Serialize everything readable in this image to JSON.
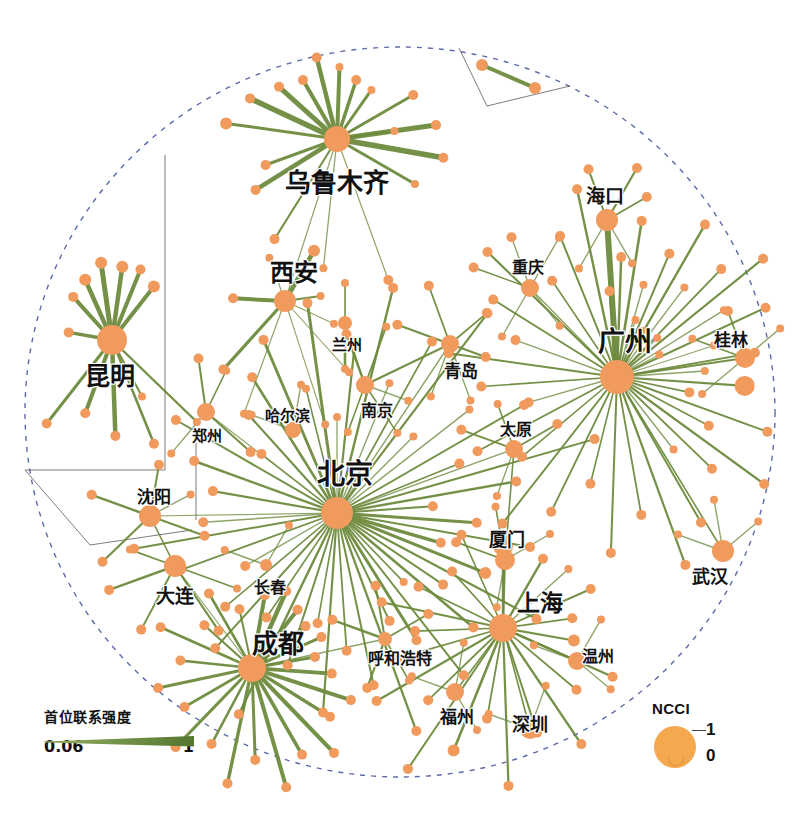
{
  "figure": {
    "title": "",
    "background": "#ffffff",
    "node_color": "#F09A5E",
    "edge_color": "#6E8B3D",
    "boundary_style": "dashed-circle",
    "boundary_color": "#5B6BA8"
  },
  "legend_strength": {
    "title": "首位联系强度",
    "min_label": "0.06",
    "max_label": "1",
    "bar_color": "#6E8B3D"
  },
  "legend_ncci": {
    "title": "NCCI",
    "max_label": "1",
    "min_label": "0",
    "circle_color": "#F5A94E"
  },
  "chart_data": {
    "type": "network",
    "node_size_metric": "NCCI",
    "node_size_range": [
      0,
      1
    ],
    "edge_weight_metric": "首位联系强度",
    "edge_weight_range": [
      0.06,
      1
    ],
    "labeled_nodes": [
      {
        "name": "乌鲁木齐",
        "x": 337,
        "y": 139,
        "r": 13,
        "label_x": 337,
        "label_y": 180,
        "font": 26
      },
      {
        "name": "西安",
        "x": 285,
        "y": 301,
        "r": 11,
        "label_x": 294,
        "label_y": 270,
        "font": 24
      },
      {
        "name": "昆明",
        "x": 112,
        "y": 340,
        "r": 15,
        "label_x": 110,
        "label_y": 374,
        "font": 25
      },
      {
        "name": "兰州",
        "x": 345,
        "y": 323,
        "r": 7,
        "label_x": 347,
        "label_y": 343,
        "font": 15
      },
      {
        "name": "青岛",
        "x": 450,
        "y": 344,
        "r": 9,
        "label_x": 461,
        "label_y": 369,
        "font": 17
      },
      {
        "name": "南京",
        "x": 365,
        "y": 385,
        "r": 9,
        "label_x": 377,
        "label_y": 409,
        "font": 16
      },
      {
        "name": "哈尔滨",
        "x": 293,
        "y": 430,
        "r": 8,
        "label_x": 287,
        "label_y": 414,
        "font": 15
      },
      {
        "name": "郑州",
        "x": 206,
        "y": 412,
        "r": 9,
        "label_x": 207,
        "label_y": 434,
        "font": 15
      },
      {
        "name": "北京",
        "x": 337,
        "y": 513,
        "r": 16,
        "label_x": 345,
        "label_y": 472,
        "font": 28
      },
      {
        "name": "沈阳",
        "x": 150,
        "y": 516,
        "r": 11,
        "label_x": 154,
        "label_y": 495,
        "font": 17
      },
      {
        "name": "大连",
        "x": 175,
        "y": 566,
        "r": 11,
        "label_x": 175,
        "label_y": 594,
        "font": 19
      },
      {
        "name": "长春",
        "x": 266,
        "y": 565,
        "r": 6,
        "label_x": 270,
        "label_y": 586,
        "font": 16
      },
      {
        "name": "成都",
        "x": 252,
        "y": 668,
        "r": 14,
        "label_x": 278,
        "label_y": 641,
        "font": 26
      },
      {
        "name": "呼和浩特",
        "x": 385,
        "y": 639,
        "r": 7,
        "label_x": 400,
        "label_y": 657,
        "font": 16
      },
      {
        "name": "重庆",
        "x": 530,
        "y": 288,
        "r": 9,
        "label_x": 528,
        "label_y": 266,
        "font": 16
      },
      {
        "name": "海口",
        "x": 607,
        "y": 220,
        "r": 11,
        "label_x": 605,
        "label_y": 194,
        "font": 19
      },
      {
        "name": "广州",
        "x": 617,
        "y": 377,
        "r": 17,
        "label_x": 625,
        "label_y": 339,
        "font": 27
      },
      {
        "name": "桂林",
        "x": 745,
        "y": 358,
        "r": 10,
        "label_x": 731,
        "label_y": 338,
        "font": 17
      },
      {
        "name": "太原",
        "x": 514,
        "y": 449,
        "r": 9,
        "label_x": 516,
        "label_y": 428,
        "font": 16
      },
      {
        "name": "厦门",
        "x": 505,
        "y": 560,
        "r": 10,
        "label_x": 507,
        "label_y": 538,
        "font": 18
      },
      {
        "name": "武汉",
        "x": 723,
        "y": 551,
        "r": 11,
        "label_x": 710,
        "label_y": 575,
        "font": 18
      },
      {
        "name": "上海",
        "x": 503,
        "y": 628,
        "r": 14,
        "label_x": 540,
        "label_y": 601,
        "font": 23
      },
      {
        "name": "温州",
        "x": 577,
        "y": 661,
        "r": 9,
        "label_x": 598,
        "label_y": 655,
        "font": 16
      },
      {
        "name": "福州",
        "x": 455,
        "y": 692,
        "r": 9,
        "label_x": 457,
        "label_y": 715,
        "font": 17
      },
      {
        "name": "深圳",
        "x": 530,
        "y": 729,
        "r": 10,
        "label_x": 530,
        "label_y": 723,
        "font": 18
      }
    ]
  }
}
